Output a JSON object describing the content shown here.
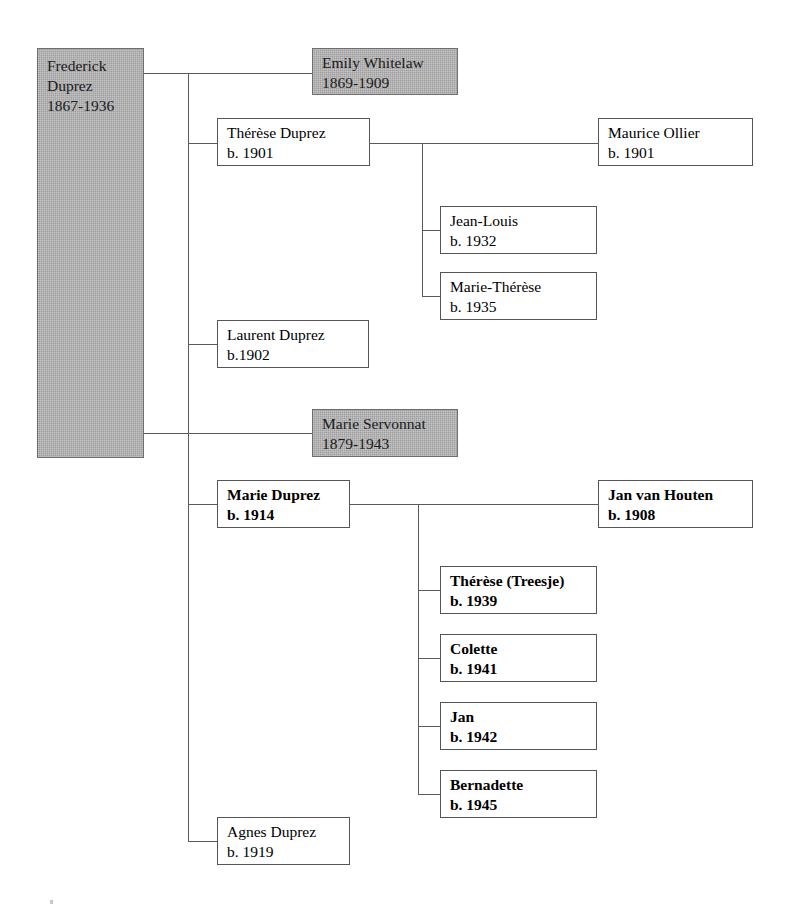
{
  "diagram": {
    "type": "genealogy-tree",
    "line_color": "#5a5a5a",
    "shaded_fill": "#9d9d9d",
    "box_fill": "#ffffff"
  },
  "people": {
    "frederick": {
      "name": "Frederick Duprez",
      "name_line1": "Frederick",
      "name_line2": "Duprez",
      "dates": "1867-1936",
      "shaded": true,
      "bold": false
    },
    "emily": {
      "name": "Emily Whitelaw",
      "dates": "1869-1909",
      "shaded": true,
      "bold": false
    },
    "therese_duprez": {
      "name": "Thérèse Duprez",
      "dates": "b. 1901",
      "shaded": false,
      "bold": false
    },
    "maurice": {
      "name": "Maurice Ollier",
      "dates": "b. 1901",
      "shaded": false,
      "bold": false
    },
    "jean_louis": {
      "name": "Jean-Louis",
      "dates": "b. 1932",
      "shaded": false,
      "bold": false
    },
    "marie_therese": {
      "name": "Marie-Thérèse",
      "dates": "b. 1935",
      "shaded": false,
      "bold": false
    },
    "laurent": {
      "name": "Laurent Duprez",
      "dates": "b.1902",
      "shaded": false,
      "bold": false
    },
    "marie_servonnat": {
      "name": "Marie Servonnat",
      "dates": "1879-1943",
      "shaded": true,
      "bold": false
    },
    "marie_duprez": {
      "name": "Marie Duprez",
      "dates": "b. 1914",
      "shaded": false,
      "bold": true
    },
    "jan_van_houten": {
      "name": "Jan van Houten",
      "dates": "b. 1908",
      "shaded": false,
      "bold": true
    },
    "therese_treesje": {
      "name": "Thérèse (Treesje)",
      "dates": "b. 1939",
      "shaded": false,
      "bold": true
    },
    "colette": {
      "name": "Colette",
      "dates": "b. 1941",
      "shaded": false,
      "bold": true
    },
    "jan": {
      "name": "Jan",
      "dates": "b. 1942",
      "shaded": false,
      "bold": true
    },
    "bernadette": {
      "name": "Bernadette",
      "dates": "b. 1945",
      "shaded": false,
      "bold": true
    },
    "agnes": {
      "name": "Agnes Duprez",
      "dates": "b. 1919",
      "shaded": false,
      "bold": false
    }
  }
}
